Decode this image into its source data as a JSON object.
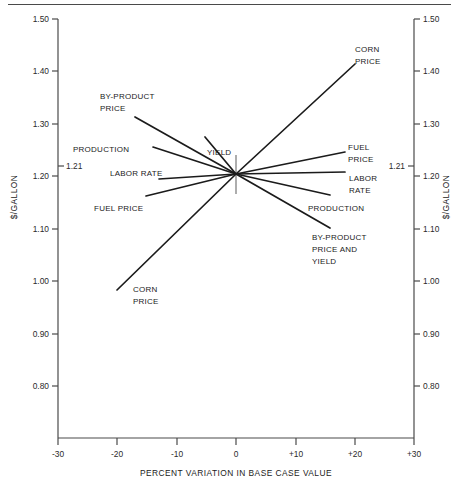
{
  "chart_data": {
    "type": "line",
    "title": "",
    "xlabel": "PERCENT VARIATION IN BASE CASE VALUE",
    "ylabel": "$/GALLON",
    "ylabel_right": "$/GALLON",
    "xlim": [
      -30,
      30
    ],
    "ylim": [
      0.75,
      1.5
    ],
    "grid": false,
    "legend": "inline-labels",
    "base_case": {
      "x": 0,
      "y": 1.21,
      "label": "1.21"
    },
    "x_ticks": [
      "-30",
      "-20",
      "-10",
      "0",
      "+10",
      "+20",
      "+30"
    ],
    "x_tick_values": [
      -30,
      -20,
      -10,
      0,
      10,
      20,
      30
    ],
    "y_ticks": [
      "1.50",
      "1.40",
      "1.30",
      "1.20",
      "1.10",
      "1.00",
      "0.90",
      "0.80"
    ],
    "y_tick_values": [
      1.5,
      1.4,
      1.3,
      1.2,
      1.1,
      1.0,
      0.9,
      0.8
    ],
    "y_ticks_right": [
      "1.50",
      "1.40",
      "1.30",
      "1.20",
      "1.10",
      "1.00",
      "0.90",
      "0.80"
    ],
    "base_label_left": "1.21",
    "base_label_right": "1.21",
    "series": [
      {
        "name": "CORN PRICE",
        "x": [
          -20,
          20
        ],
        "values": [
          0.99,
          1.415
        ],
        "label_left": "CORN\nPRICE",
        "label_right": "CORN\nPRICE"
      },
      {
        "name": "BY-PRODUCT PRICE",
        "x": [
          -17,
          20
        ],
        "values": [
          1.295,
          1.105
        ],
        "label_left": "BY-PRODUCT\nPRICE",
        "label_right": "BY-PRODUCT\nPRICE AND\nYIELD"
      },
      {
        "name": "PRODUCTION",
        "x": [
          -14,
          20
        ],
        "values": [
          1.262,
          1.168
        ],
        "label_left": "PRODUCTION",
        "label_right": "PRODUCTION"
      },
      {
        "name": "LABOR RATE",
        "x": [
          -13,
          20
        ],
        "values": [
          1.204,
          1.206
        ],
        "label_left": "LABOR RATE",
        "label_right": "LABOR\nRATE"
      },
      {
        "name": "FUEL PRICE",
        "x": [
          -15,
          20
        ],
        "values": [
          1.178,
          1.252
        ],
        "label_left": "FUEL PRICE",
        "label_right": "FUEL\nPRICE"
      },
      {
        "name": "YIELD",
        "x": [
          -7,
          20
        ],
        "values": [
          1.257,
          1.105
        ],
        "label_left": "YIELD",
        "label_right": "BY-PRODUCT\nPRICE AND\nYIELD"
      }
    ],
    "annotations": [
      {
        "id": "lbl-by-product-price-l",
        "text_lines": [
          "BY-PRODUCT",
          "PRICE"
        ],
        "x": 100,
        "y": 95
      },
      {
        "id": "lbl-production-l",
        "text_lines": [
          "PRODUCTION"
        ],
        "x": 73,
        "y": 148
      },
      {
        "id": "lbl-labor-rate-l",
        "text_lines": [
          "LABOR RATE"
        ],
        "x": 110,
        "y": 172
      },
      {
        "id": "lbl-fuel-price-l",
        "text_lines": [
          "FUEL PRICE"
        ],
        "x": 94,
        "y": 207
      },
      {
        "id": "lbl-yield",
        "text_lines": [
          "YIELD"
        ],
        "x": 207,
        "y": 153
      },
      {
        "id": "lbl-corn-price-l",
        "text_lines": [
          "CORN",
          "PRICE"
        ],
        "x": 133,
        "y": 288
      },
      {
        "id": "lbl-corn-price-r",
        "text_lines": [
          "CORN",
          "PRICE"
        ],
        "x": 355,
        "y": 49
      },
      {
        "id": "lbl-fuel-price-r",
        "text_lines": [
          "FUEL",
          "PRICE"
        ],
        "x": 348,
        "y": 147
      },
      {
        "id": "lbl-labor-rate-r",
        "text_lines": [
          "LABOR",
          "RATE"
        ],
        "x": 349,
        "y": 178
      },
      {
        "id": "lbl-production-r",
        "text_lines": [
          "PRODUCTION"
        ],
        "x": 308,
        "y": 207
      },
      {
        "id": "lbl-by-product-yield-r",
        "text_lines": [
          "BY-PRODUCT",
          "PRICE AND",
          "YIELD"
        ],
        "x": 312,
        "y": 237
      }
    ],
    "colors": {
      "line": "#1b1b1b",
      "axis": "#4a4a4a",
      "text": "#1b1b1b",
      "background": "#ffffff"
    }
  }
}
